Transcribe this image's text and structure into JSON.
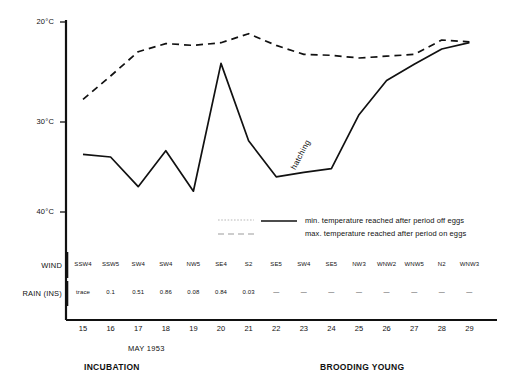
{
  "chart_data": {
    "type": "line",
    "title": "",
    "xlabel": "MAY 1953",
    "ylabel": "",
    "ylim": [
      40,
      20
    ],
    "y_inverted": true,
    "grid": false,
    "legend_position": "inside-lower-right",
    "y_ticks": [
      "20°C",
      "30°C",
      "40°C"
    ],
    "y_tick_values": [
      20,
      30,
      40
    ],
    "x": [
      15,
      16,
      17,
      18,
      19,
      20,
      21,
      22,
      23,
      24,
      25,
      26,
      27,
      28,
      29
    ],
    "categories": [
      "15",
      "16",
      "17",
      "18",
      "19",
      "20",
      "21",
      "22",
      "23",
      "24",
      "25",
      "26",
      "27",
      "28",
      "29"
    ],
    "series": [
      {
        "name": "min. temperature reached after period off eggs",
        "style": "solid",
        "values": [
          34.7,
          35.0,
          38.3,
          34.3,
          38.8,
          24.6,
          33.2,
          37.2,
          36.7,
          36.3,
          30.3,
          26.5,
          24.7,
          23.0,
          22.3
        ]
      },
      {
        "name": "max. temperature reached after period on eggs",
        "style": "dashed",
        "values": [
          28.6,
          26.0,
          23.3,
          22.4,
          22.6,
          22.3,
          21.3,
          22.6,
          23.6,
          23.7,
          24.0,
          23.8,
          23.6,
          22.0,
          22.2
        ]
      }
    ],
    "annotations": [
      {
        "text": "hatching",
        "x": 23.2,
        "y": 32.0,
        "rotation": -62
      }
    ]
  },
  "legend": {
    "items": [
      {
        "label": "min. temperature reached after period off eggs",
        "style": "solid"
      },
      {
        "label": "max. temperature reached after period on eggs",
        "style": "dashed"
      }
    ]
  },
  "rows": {
    "wind": {
      "label": "WIND",
      "values": [
        "SSW4",
        "SSW5",
        "SW4",
        "SW4",
        "NW5",
        "SE4",
        "S2",
        "SE5",
        "SW4",
        "SE5",
        "NW3",
        "WNW2",
        "WNW5",
        "N2",
        "WNW3"
      ]
    },
    "rain": {
      "label": "RAIN (INS)",
      "values": [
        "trace",
        "0.1",
        "0.51",
        "0.86",
        "0.08",
        "0.84",
        "0.03",
        "—",
        "—",
        "—",
        "—",
        "—",
        "—",
        "—",
        "—"
      ]
    }
  },
  "axis": {
    "month": "MAY 1953"
  },
  "phases": [
    {
      "label": "INCUBATION"
    },
    {
      "label": "BROODING YOUNG"
    }
  ],
  "colors": {
    "line": "#111111",
    "axis": "#111111",
    "background": "#ffffff"
  }
}
